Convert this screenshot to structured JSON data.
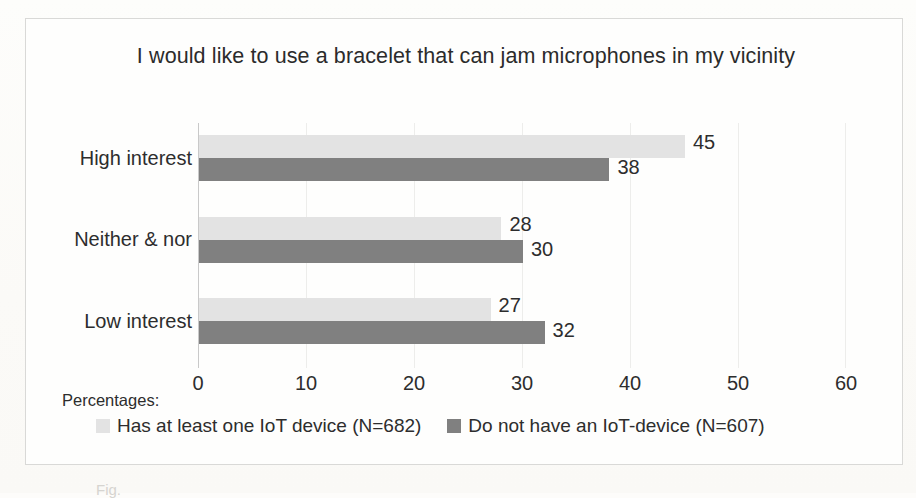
{
  "chart_data": {
    "type": "bar",
    "orientation": "horizontal",
    "title": "I would like to use a bracelet that can jam microphones in my vicinity",
    "xlabel": "",
    "ylabel": "",
    "xlim": [
      0,
      60
    ],
    "xticks": [
      0,
      10,
      20,
      30,
      40,
      50,
      60
    ],
    "grid": "vertical-only",
    "legend_position": "bottom",
    "value_axis_caption": "Percentages:",
    "categories": [
      "High interest",
      "Neither & nor",
      "Low interest"
    ],
    "series": [
      {
        "name": "Has at least one IoT device (N=682)",
        "color": "#e3e3e3",
        "values": [
          45,
          28,
          27
        ]
      },
      {
        "name": "Do not have an IoT-device (N=607)",
        "color": "#808080",
        "values": [
          38,
          30,
          32
        ]
      }
    ]
  },
  "caption_stub": "Fig."
}
